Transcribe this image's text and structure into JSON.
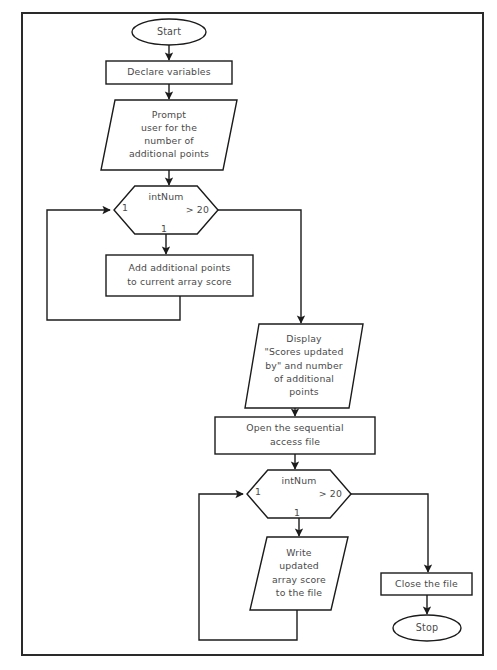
{
  "diagram": {
    "type": "flowchart",
    "canvas": {
      "width": 497,
      "height": 670
    },
    "border": {
      "x": 22,
      "y": 13,
      "width": 461,
      "height": 642,
      "color": "#2a2a2a"
    },
    "line_color": "#1b1b1b",
    "text_color": "#4a4a4a",
    "fill_color": "#ffffff"
  },
  "nodes": {
    "start": {
      "shape": "oval",
      "label": "Start",
      "cx": 169,
      "cy": 32,
      "rx": 37,
      "ry": 13
    },
    "declare": {
      "shape": "rectangle",
      "label": "Declare variables",
      "x": 106,
      "y": 61,
      "width": 126,
      "height": 23
    },
    "prompt": {
      "shape": "parallelogram",
      "lines": [
        "Prompt",
        "user for the",
        "number of",
        "additional points"
      ],
      "x": 101,
      "y": 100,
      "width": 136,
      "height": 70,
      "skew": 14
    },
    "decision1": {
      "shape": "hexagon",
      "label_top": "intNum",
      "label_left": "1",
      "label_right": "> 20",
      "label_bottom": "1",
      "x": 114,
      "y": 186,
      "width": 104,
      "height": 48
    },
    "add_points": {
      "shape": "rectangle",
      "lines": [
        "Add additional points",
        "to current array score"
      ],
      "x": 106,
      "y": 255,
      "width": 147,
      "height": 41
    },
    "display": {
      "shape": "parallelogram",
      "lines": [
        "Display",
        "\"Scores updated",
        "by\" and number",
        "of additional",
        "points"
      ],
      "x": 245,
      "y": 324,
      "width": 118,
      "height": 84,
      "skew": 14
    },
    "open_file": {
      "shape": "rectangle",
      "lines": [
        "Open the sequential",
        "access file"
      ],
      "x": 215,
      "y": 417,
      "width": 160,
      "height": 37
    },
    "decision2": {
      "shape": "hexagon",
      "label_top": "intNum",
      "label_left": "1",
      "label_right": "> 20",
      "label_bottom": "1",
      "x": 247,
      "y": 470,
      "width": 104,
      "height": 48
    },
    "write": {
      "shape": "parallelogram",
      "lines": [
        "Write",
        "updated",
        "array score",
        "to the file"
      ],
      "x": 250,
      "y": 537,
      "width": 98,
      "height": 73,
      "skew": 17
    },
    "close_file": {
      "shape": "rectangle",
      "label": "Close the file",
      "x": 381,
      "y": 573,
      "width": 91,
      "height": 22
    },
    "stop": {
      "shape": "oval",
      "label": "Stop",
      "cx": 427,
      "cy": 628,
      "rx": 34,
      "ry": 13
    }
  },
  "connectors": [
    {
      "name": "start-to-declare",
      "points": "169,45 169,60",
      "arrow": true
    },
    {
      "name": "declare-to-prompt",
      "points": "169,84 169,99",
      "arrow": true
    },
    {
      "name": "prompt-to-decision1",
      "points": "169,170 169,185",
      "arrow": true
    },
    {
      "name": "decision1-true-to-add",
      "points": "166,234 166,254",
      "arrow": true
    },
    {
      "name": "add-loopback-to-decision1",
      "points": "180,296 180,320 47,320 47,210 110,210",
      "arrow": true
    },
    {
      "name": "decision1-false-to-display",
      "points": "218,210 301,210 301,323",
      "arrow": true
    },
    {
      "name": "display-to-open-file",
      "points": "295,408 295,416",
      "arrow": true
    },
    {
      "name": "open-file-to-decision2",
      "points": "295,454 295,469",
      "arrow": true
    },
    {
      "name": "decision2-true-to-write",
      "points": "299,518 299,536",
      "arrow": true
    },
    {
      "name": "write-loopback-to-decision2",
      "points": "297,610 297,640 199,640 199,494 243,494",
      "arrow": true
    },
    {
      "name": "decision2-false-to-close",
      "points": "351,494 428,494 428,572",
      "arrow": true
    },
    {
      "name": "close-to-stop",
      "points": "427,595 427,614",
      "arrow": true
    }
  ]
}
